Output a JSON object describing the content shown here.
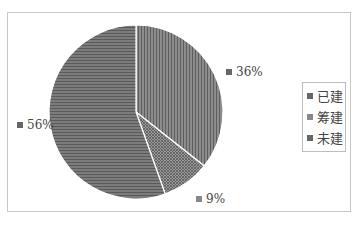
{
  "chart_data": {
    "type": "pie",
    "title": "",
    "categories": [
      "已建",
      "筹建",
      "未建"
    ],
    "values": [
      36,
      9,
      56
    ],
    "labels": [
      "36%",
      "9%",
      "56%"
    ],
    "colors": [
      "#7a7a7a",
      "#8a8a8a",
      "#6e6e6e"
    ],
    "patterns": [
      "vertical-stripes",
      "diagonal-crosshatch",
      "horizontal-stripes"
    ],
    "legend_position": "right",
    "start_angle": "12 o'clock",
    "direction": "clockwise"
  },
  "legend": {
    "items": [
      {
        "label": "已建"
      },
      {
        "label": "筹建"
      },
      {
        "label": "未建"
      }
    ]
  },
  "data_labels": {
    "built": "36%",
    "planned": "9%",
    "unbuilt": "56%"
  }
}
